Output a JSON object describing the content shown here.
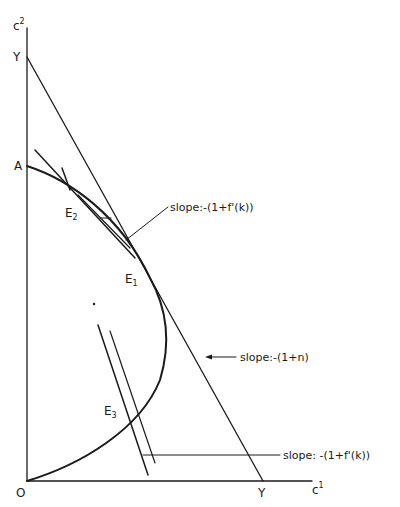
{
  "figure": {
    "type": "economic-diagram",
    "axes": {
      "x_label": "c",
      "x_label_sup": "1",
      "y_label": "c",
      "y_label_sup": "2",
      "origin_label": "O"
    },
    "points": {
      "y_intercept_label": "Y",
      "x_intercept_label": "Y",
      "curve_start_label": "A",
      "e1": {
        "base": "E",
        "sub": "1"
      },
      "e2": {
        "base": "E",
        "sub": "2"
      },
      "e3": {
        "base": "E",
        "sub": "3"
      }
    },
    "annotations": {
      "slope_upper": "slope:-(1+f'(k))",
      "slope_budget": "slope:-(1+n)",
      "slope_lower": "slope: -(1+f'(k))"
    },
    "colors": {
      "ink": "#1a1a1a",
      "background": "#ffffff"
    }
  }
}
